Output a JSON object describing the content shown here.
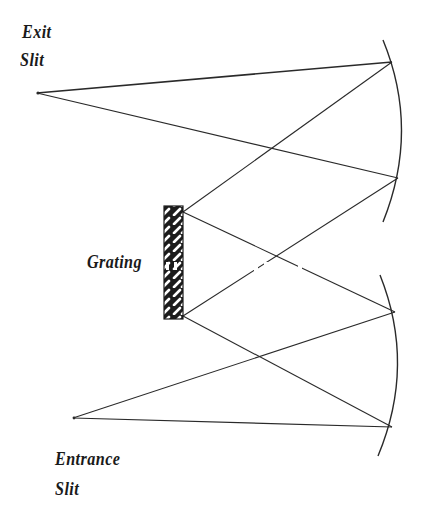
{
  "diagram": {
    "labels": {
      "exit_line1": "Exit",
      "exit_line2": "Slit",
      "grating": "Grating",
      "entrance_line1": "Entrance",
      "entrance_line2": "Slit"
    },
    "colors": {
      "line": "#2a2a2a",
      "background": "#ffffff",
      "text": "#1a1a1a"
    },
    "points": {
      "exit_slit": [
        37,
        93
      ],
      "entrance_slit": [
        73,
        418
      ],
      "grating_top": [
        183,
        212
      ],
      "grating_bottom": [
        183,
        316
      ],
      "top_mirror_upper": [
        392,
        62
      ],
      "top_mirror_lower": [
        398,
        178
      ],
      "bottom_mirror_upper": [
        395,
        312
      ],
      "bottom_mirror_lower": [
        392,
        427
      ]
    },
    "components": [
      "Exit Slit",
      "Collimating Mirror (top)",
      "Grating",
      "Focusing Mirror (bottom)",
      "Entrance Slit"
    ]
  }
}
